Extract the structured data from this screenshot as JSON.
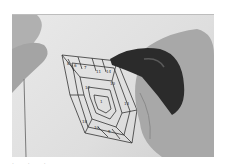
{
  "image": {
    "description": "Black-and-white photo of a hand using a marker to trace a paper-piecing pineapple/spiral quilt pattern on paper, left hand fingers holding the sheet",
    "subjects": [
      "left-hand-fingers",
      "right-hand-with-marker",
      "paper-piecing-pattern"
    ],
    "pattern_numbers": [
      "8",
      "6",
      "5",
      "4",
      "7",
      "11",
      "14",
      "12",
      "10",
      "13",
      "9",
      "15",
      "3",
      "2",
      "1",
      "16",
      "18"
    ],
    "colors": {
      "background": "#ffffff",
      "paper": "#e4e4e4",
      "skin": "#a9a9a9",
      "marker": "#2a2a2a",
      "lines": "#3a3a3a"
    }
  },
  "caption": {
    "text": ". . ."
  }
}
